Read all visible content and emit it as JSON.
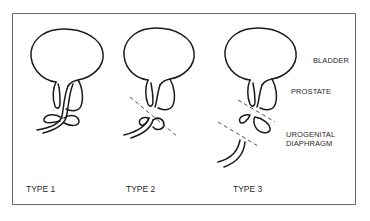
{
  "figure": {
    "anatomy_labels": {
      "bladder": "BLADDER",
      "prostate": "PROSTATE",
      "urogenital_diaphragm_line1": "UROGENITAL",
      "urogenital_diaphragm_line2": "DIAPHRAGM"
    },
    "panels": [
      {
        "label": "TYPE 1",
        "injury_lines": 0
      },
      {
        "label": "TYPE 2",
        "injury_lines": 1
      },
      {
        "label": "TYPE 3",
        "injury_lines": 2
      }
    ],
    "colors": {
      "stroke": "#1a1a1a",
      "dashed": "#555555",
      "border": "#6a6a6a",
      "text": "#2a2a2a"
    }
  }
}
